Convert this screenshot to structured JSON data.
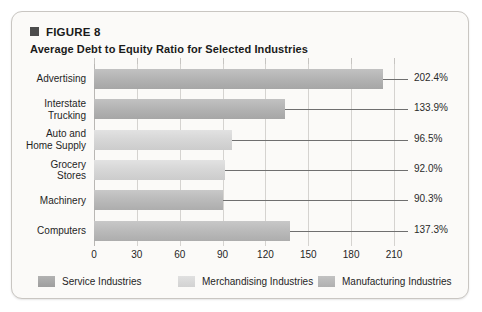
{
  "figure": {
    "label": "FIGURE 8",
    "subtitle": "Average Debt to Equity Ratio for Selected Industries",
    "bullet_color": "#4c4c4c"
  },
  "chart_data": {
    "type": "bar",
    "orientation": "horizontal",
    "title": "Average Debt to Equity Ratio for Selected Industries",
    "xlabel": "",
    "ylabel": "",
    "xlim": [
      0,
      210
    ],
    "xticks": [
      0,
      30,
      60,
      90,
      120,
      150,
      180,
      210
    ],
    "xtick_labels": [
      "0",
      "30",
      "60",
      "90",
      "120",
      "150",
      "180",
      "210"
    ],
    "grid": true,
    "legend_position": "bottom",
    "categories": [
      "Advertising",
      "Interstate Trucking",
      "Auto and Home Supply",
      "Grocery Stores",
      "Machinery",
      "Computers"
    ],
    "values": [
      202.4,
      133.9,
      96.5,
      92.0,
      90.3,
      137.3
    ],
    "value_labels": [
      "202.4%",
      "133.9%",
      "96.5%",
      "92.0%",
      "90.3%",
      "137.3%"
    ],
    "groups": [
      "Service",
      "Service",
      "Merchandising",
      "Merchandising",
      "Manufacturing",
      "Manufacturing"
    ],
    "series": [
      {
        "name": "Service Industries",
        "color": "#b4b4b4",
        "points": [
          {
            "category": "Advertising",
            "value": 202.4,
            "label": "202.4%"
          },
          {
            "category": "Interstate Trucking",
            "value": 133.9,
            "label": "133.9%"
          }
        ]
      },
      {
        "name": "Merchandising Industries",
        "color": "#d7d7d7",
        "points": [
          {
            "category": "Auto and Home Supply",
            "value": 96.5,
            "label": "96.5%"
          },
          {
            "category": "Grocery Stores",
            "value": 92.0,
            "label": "92.0%"
          }
        ]
      },
      {
        "name": "Manufacturing Industries",
        "color": "#bbbbbb",
        "points": [
          {
            "category": "Machinery",
            "value": 90.3,
            "label": "90.3%"
          },
          {
            "category": "Computers",
            "value": 137.3,
            "label": "137.3%"
          }
        ]
      }
    ]
  },
  "category_labels": [
    {
      "lines": [
        "Advertising"
      ]
    },
    {
      "lines": [
        "Interstate",
        "Trucking"
      ]
    },
    {
      "lines": [
        "Auto and",
        "Home Supply"
      ]
    },
    {
      "lines": [
        "Grocery",
        "Stores"
      ]
    },
    {
      "lines": [
        "Machinery"
      ]
    },
    {
      "lines": [
        "Computers"
      ]
    }
  ],
  "legend": {
    "items": [
      {
        "label": "Service Industries",
        "swatch_class": "service"
      },
      {
        "label": "Merchandising Industries",
        "swatch_class": "merch"
      },
      {
        "label": "Manufacturing Industries",
        "swatch_class": "manuf"
      }
    ]
  }
}
